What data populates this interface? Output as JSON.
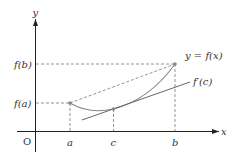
{
  "diagram": {
    "axes": {
      "x_label": "x",
      "y_label": "y",
      "origin_label": "O"
    },
    "x_ticks": [
      {
        "label": "a",
        "px": 70
      },
      {
        "label": "c",
        "px": 113.5
      },
      {
        "label": "b",
        "px": 175
      }
    ],
    "y_ticks": [
      {
        "label": "f(b)",
        "px": 64
      },
      {
        "label": "f(a)",
        "px": 103
      }
    ],
    "curve_label": "y = f(x)",
    "tangent_label": "f′(c)",
    "points": {
      "A": {
        "x": 70,
        "y": 103
      },
      "C": {
        "x": 113.5,
        "y": 109
      },
      "B": {
        "x": 175,
        "y": 64
      }
    },
    "colors": {
      "axis": "#222222",
      "curve": "#888888",
      "tangent": "#666666",
      "dashed": "#777777",
      "text": "#333333"
    }
  }
}
